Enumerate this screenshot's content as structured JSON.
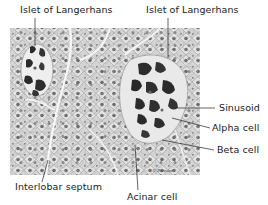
{
  "figure": {
    "labels": {
      "islet_left": "Islet of Langerhans",
      "islet_right": "Islet of Langerhans",
      "sinusoid": "Sinusoid",
      "alpha_cell": "Alpha cell",
      "beta_cell": "Beta cell",
      "interlobar_septum": "Interlobar septum",
      "acinar_cell": "Acinar cell"
    },
    "signature": "© Parnam",
    "colors": {
      "tissue_bg": "#d9d9d9",
      "cell_fill": "#e6e6e6",
      "nucleus": "#5a5a5a",
      "islet_cell": "#2b2b2b",
      "line": "#222222"
    }
  }
}
